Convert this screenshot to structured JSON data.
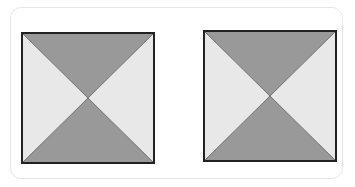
{
  "diagram": {
    "type": "two squares divided by diagonals",
    "colors": {
      "dark_triangle": "#999999",
      "light_triangle": "#e8e8e8",
      "outline": "#222222",
      "frame": "#e6e6e6"
    },
    "figures": [
      {
        "id": "left-square",
        "x": 21,
        "y": 32,
        "size": 133,
        "shaded": [
          "top",
          "bottom"
        ],
        "unshaded": [
          "left",
          "right"
        ]
      },
      {
        "id": "right-square",
        "x": 203,
        "y": 30,
        "size": 133,
        "shaded": [
          "top",
          "bottom"
        ],
        "unshaded": [
          "left",
          "right"
        ]
      }
    ]
  }
}
